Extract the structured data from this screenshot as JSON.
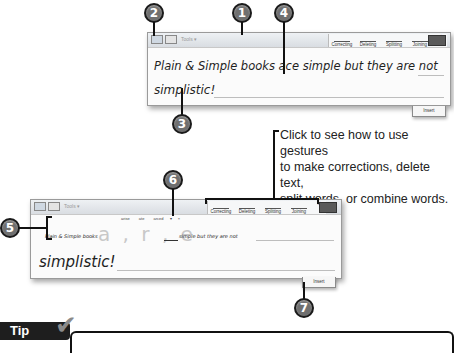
{
  "callouts": {
    "c1": "1",
    "c2": "2",
    "c3": "3",
    "c4": "4",
    "c5": "5",
    "c6": "6",
    "c7": "7"
  },
  "panel_top": {
    "toolbar": {
      "tools_label": "Tools ▾",
      "gestures": [
        "Correcting",
        "Deleting",
        "Splitting",
        "Joining"
      ]
    },
    "line1": "Plain & Simple books ace simple but they are not",
    "line2": "simplistic!",
    "insert_label": "Insert"
  },
  "panel_bottom": {
    "toolbar": {
      "tools_label": "Tools ▾",
      "gestures": [
        "Correcting",
        "Deleting",
        "Splitting",
        "Joining"
      ]
    },
    "alternates": [
      "arise",
      "ate",
      "arced",
      "▾",
      "×"
    ],
    "line1_prefix": "Plain & Simple books",
    "line1_letters": "a , r , e",
    "line1_suffix": "simple but they are not",
    "line2": "simplistic!",
    "insert_label": "Insert"
  },
  "note": {
    "lines": [
      "Click to see how to use gestures",
      "to make corrections, delete text,",
      "split words, or combine words."
    ]
  },
  "tip": {
    "label": "Tip"
  }
}
